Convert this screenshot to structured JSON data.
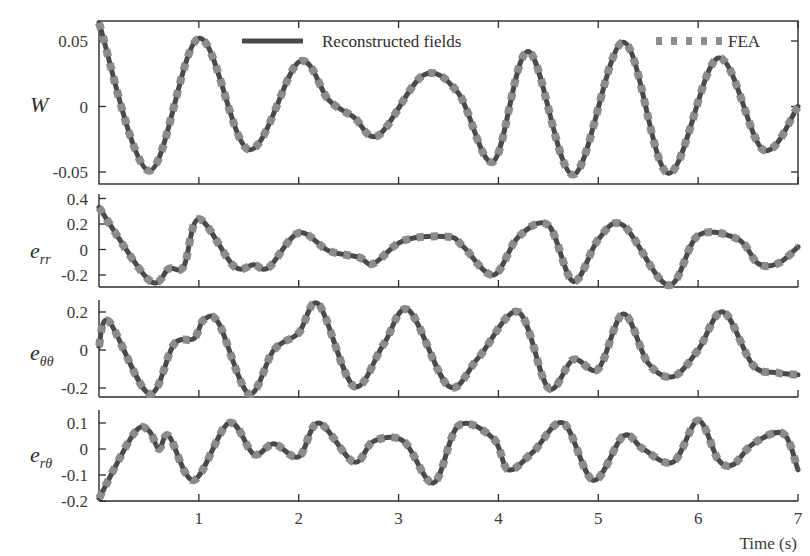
{
  "chart_data": {
    "type": "line",
    "layout": "4 vertically stacked panels sharing x-axis",
    "xlabel": "Time (s)",
    "xlim": [
      0,
      7
    ],
    "xticks": [
      1,
      2,
      3,
      4,
      5,
      6,
      7
    ],
    "legend": {
      "position": "top of first panel",
      "entries": [
        {
          "name": "Reconstructed fields",
          "style": "solid dark gray",
          "color": "#4a4a4a"
        },
        {
          "name": "FEA",
          "style": "dotted light gray",
          "color": "#8c8c8c"
        }
      ]
    },
    "panels": [
      {
        "id": "W",
        "ylabel": "W",
        "ylabel_sub": "",
        "yticks": [
          0.05,
          0,
          -0.05
        ],
        "ytick_labels": [
          "0.05",
          "0",
          "-0.05"
        ],
        "ylim": [
          -0.06,
          0.065
        ],
        "x": [
          0,
          0.5,
          1.0,
          1.5,
          2.0,
          2.3,
          2.55,
          2.8,
          3.25,
          3.6,
          3.95,
          4.3,
          4.75,
          5.25,
          5.7,
          6.2,
          6.65,
          7.0
        ],
        "series": [
          {
            "name": "Reconstructed fields",
            "values": [
              0.064,
              -0.049,
              0.052,
              -0.033,
              0.034,
              0.005,
              -0.008,
              -0.022,
              0.024,
              0.01,
              -0.042,
              0.042,
              -0.052,
              0.049,
              -0.051,
              0.037,
              -0.033,
              0.0
            ]
          },
          {
            "name": "FEA",
            "values": [
              0.064,
              -0.049,
              0.052,
              -0.033,
              0.034,
              0.005,
              -0.008,
              -0.022,
              0.024,
              0.01,
              -0.042,
              0.042,
              -0.052,
              0.049,
              -0.051,
              0.037,
              -0.033,
              0.0
            ]
          }
        ]
      },
      {
        "id": "e_rr",
        "ylabel": "e",
        "ylabel_sub": "rr",
        "yticks": [
          0.4,
          0.2,
          0,
          -0.2
        ],
        "ytick_labels": [
          "0.4",
          "0.2",
          "0",
          "-0.2"
        ],
        "ylim": [
          -0.3,
          0.4
        ],
        "x": [
          0,
          0.5,
          0.7,
          0.85,
          1.0,
          1.35,
          1.55,
          1.7,
          2.0,
          2.3,
          2.6,
          2.75,
          3.05,
          3.5,
          3.65,
          3.95,
          4.2,
          4.5,
          4.75,
          5.0,
          5.25,
          5.7,
          6.0,
          6.4,
          6.6,
          6.8,
          7.0
        ],
        "series": [
          {
            "name": "Reconstructed fields",
            "values": [
              0.33,
              -0.24,
              -0.15,
              -0.13,
              0.24,
              -0.13,
              -0.12,
              -0.14,
              0.13,
              -0.01,
              -0.06,
              -0.11,
              0.07,
              0.1,
              0.02,
              -0.2,
              0.1,
              0.19,
              -0.25,
              0.08,
              0.19,
              -0.28,
              0.11,
              0.08,
              -0.11,
              -0.11,
              0.02
            ]
          },
          {
            "name": "FEA",
            "values": [
              0.33,
              -0.24,
              -0.15,
              -0.13,
              0.24,
              -0.13,
              -0.12,
              -0.14,
              0.13,
              -0.01,
              -0.06,
              -0.11,
              0.07,
              0.1,
              0.02,
              -0.2,
              0.1,
              0.19,
              -0.25,
              0.08,
              0.19,
              -0.28,
              0.11,
              0.08,
              -0.11,
              -0.11,
              0.02
            ]
          }
        ]
      },
      {
        "id": "e_thth",
        "ylabel": "e",
        "ylabel_sub": "θθ",
        "yticks": [
          0.2,
          0,
          -0.2
        ],
        "ytick_labels": [
          "0.2",
          "0",
          "-0.2"
        ],
        "ylim": [
          -0.25,
          0.25
        ],
        "x": [
          0,
          0.1,
          0.5,
          0.75,
          0.95,
          1.05,
          1.2,
          1.5,
          1.75,
          2.0,
          2.2,
          2.55,
          2.85,
          3.1,
          3.5,
          3.8,
          4.2,
          4.5,
          4.75,
          5.0,
          5.25,
          5.5,
          5.75,
          6.0,
          6.25,
          6.55,
          6.8,
          7.0
        ],
        "series": [
          {
            "name": "Reconstructed fields",
            "values": [
              0.02,
              0.15,
              -0.23,
              0.03,
              0.06,
              0.16,
              0.14,
              -0.23,
              0.0,
              0.09,
              0.24,
              -0.19,
              0.03,
              0.21,
              -0.19,
              -0.04,
              0.2,
              -0.2,
              -0.05,
              -0.1,
              0.19,
              -0.07,
              -0.14,
              0.0,
              0.2,
              -0.08,
              -0.12,
              -0.13
            ]
          },
          {
            "name": "FEA",
            "values": [
              0.02,
              0.15,
              -0.23,
              0.03,
              0.06,
              0.16,
              0.14,
              -0.23,
              0.0,
              0.09,
              0.24,
              -0.19,
              0.03,
              0.21,
              -0.19,
              -0.04,
              0.2,
              -0.2,
              -0.05,
              -0.1,
              0.19,
              -0.07,
              -0.14,
              0.0,
              0.2,
              -0.08,
              -0.12,
              -0.13
            ]
          }
        ]
      },
      {
        "id": "e_rth",
        "ylabel": "e",
        "ylabel_sub": "rθ",
        "yticks": [
          0.1,
          0,
          -0.1,
          -0.2
        ],
        "ytick_labels": [
          "0.1",
          "0",
          "-0.1",
          "-0.2"
        ],
        "ylim": [
          -0.22,
          0.15
        ],
        "x": [
          0,
          0.35,
          0.5,
          0.6,
          0.7,
          0.95,
          1.3,
          1.55,
          1.75,
          2.0,
          2.2,
          2.55,
          2.75,
          3.05,
          3.35,
          3.6,
          3.95,
          4.1,
          4.35,
          4.65,
          4.95,
          5.25,
          5.45,
          5.75,
          6.0,
          6.2,
          6.35,
          6.55,
          6.85,
          7.0
        ],
        "series": [
          {
            "name": "Reconstructed fields",
            "values": [
              -0.19,
              0.06,
              0.07,
              0.0,
              0.05,
              -0.12,
              0.1,
              -0.02,
              0.02,
              -0.03,
              0.1,
              -0.05,
              0.03,
              0.03,
              -0.13,
              0.09,
              0.04,
              -0.08,
              -0.01,
              0.1,
              -0.12,
              0.05,
              0.0,
              -0.05,
              0.11,
              -0.04,
              -0.06,
              0.02,
              0.06,
              -0.08
            ]
          },
          {
            "name": "FEA",
            "values": [
              -0.19,
              0.06,
              0.07,
              0.0,
              0.05,
              -0.12,
              0.1,
              -0.02,
              0.02,
              -0.03,
              0.1,
              -0.05,
              0.03,
              0.03,
              -0.13,
              0.09,
              0.04,
              -0.08,
              -0.01,
              0.1,
              -0.12,
              0.05,
              0.0,
              -0.05,
              0.11,
              -0.04,
              -0.06,
              0.02,
              0.06,
              -0.08
            ]
          }
        ]
      }
    ]
  }
}
